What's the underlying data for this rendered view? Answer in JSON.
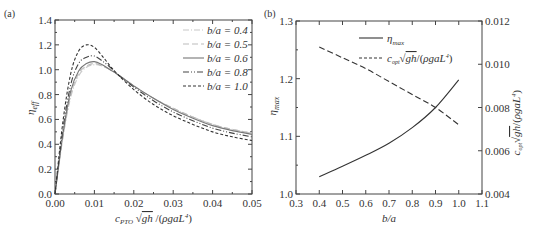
{
  "chart_data": [
    {
      "panel": "(a)",
      "type": "line",
      "title": "",
      "xlabel": "c_PTO √gh / (ρgaL⁴)",
      "ylabel": "η_eff",
      "xlim": [
        0,
        0.05
      ],
      "ylim": [
        0,
        1.4
      ],
      "xticks": [
        "0.00",
        "0.01",
        "0.02",
        "0.03",
        "0.04",
        "0.05"
      ],
      "yticks": [
        "0.0",
        "0.2",
        "0.4",
        "0.6",
        "0.8",
        "1.0",
        "1.2",
        "1.4"
      ],
      "legend_position": "upper right",
      "x": [
        0,
        0.002,
        0.004,
        0.006,
        0.008,
        0.01,
        0.012,
        0.014,
        0.016,
        0.02,
        0.025,
        0.03,
        0.035,
        0.04,
        0.045,
        0.05
      ],
      "series": [
        {
          "name": "b/a = 0.4",
          "style": "dash-dot",
          "color": "#c8c8c8",
          "values": [
            0,
            0.45,
            0.78,
            0.95,
            1.02,
            1.04,
            1.03,
            1.0,
            0.96,
            0.87,
            0.77,
            0.69,
            0.62,
            0.56,
            0.52,
            0.49
          ]
        },
        {
          "name": "b/a = 0.5",
          "style": "dashed",
          "color": "#bbbbbb",
          "values": [
            0,
            0.46,
            0.8,
            0.97,
            1.03,
            1.05,
            1.03,
            1.0,
            0.96,
            0.87,
            0.77,
            0.69,
            0.62,
            0.56,
            0.52,
            0.49
          ]
        },
        {
          "name": "b/a = 0.6",
          "style": "solid",
          "color": "#777777",
          "values": [
            0,
            0.48,
            0.83,
            0.99,
            1.05,
            1.065,
            1.04,
            1.0,
            0.96,
            0.87,
            0.77,
            0.68,
            0.61,
            0.55,
            0.51,
            0.48
          ]
        },
        {
          "name": "b/a = 0.8",
          "style": "dash-dot-dot",
          "color": "#444444",
          "values": [
            0,
            0.52,
            0.88,
            1.05,
            1.1,
            1.11,
            1.07,
            1.02,
            0.96,
            0.86,
            0.75,
            0.66,
            0.59,
            0.53,
            0.49,
            0.46
          ]
        },
        {
          "name": "b/a = 1.0",
          "style": "short-dash",
          "color": "#333333",
          "values": [
            0,
            0.58,
            0.97,
            1.15,
            1.2,
            1.18,
            1.11,
            1.03,
            0.96,
            0.84,
            0.72,
            0.63,
            0.56,
            0.5,
            0.46,
            0.43
          ]
        }
      ]
    },
    {
      "panel": "(b)",
      "type": "line",
      "title": "",
      "xlabel": "b/a",
      "ylabel": "η_max",
      "ylabel_right": "c_opt √gh / (ρgaL⁴)",
      "xlim": [
        0.3,
        1.1
      ],
      "ylim": [
        1.0,
        1.3
      ],
      "ylim_right": [
        0.004,
        0.012
      ],
      "xticks": [
        "0.3",
        "0.4",
        "0.5",
        "0.6",
        "0.7",
        "0.8",
        "0.9",
        "1.0",
        "1.1"
      ],
      "yticks": [
        "1.0",
        "1.1",
        "1.2",
        "1.3"
      ],
      "yticks_right": [
        "0.004",
        "0.006",
        "0.008",
        "0.010",
        "0.012"
      ],
      "legend_position": "upper center",
      "x": [
        0.4,
        0.5,
        0.6,
        0.7,
        0.8,
        0.9,
        1.0
      ],
      "series": [
        {
          "name": "η_max",
          "axis": "left",
          "style": "solid",
          "color": "#333333",
          "values": [
            1.03,
            1.048,
            1.067,
            1.088,
            1.115,
            1.15,
            1.198
          ]
        },
        {
          "name": "c_opt √gh / (ρgaL⁴)",
          "axis": "right",
          "style": "dashed",
          "color": "#333333",
          "values": [
            0.0108,
            0.0103,
            0.0098,
            0.0092,
            0.0086,
            0.008,
            0.0072
          ]
        }
      ]
    }
  ]
}
